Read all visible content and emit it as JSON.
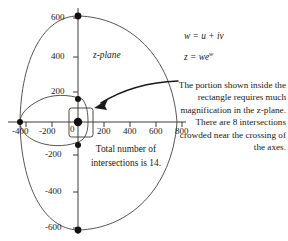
{
  "figure": {
    "plane_label": "z-plane",
    "equations": [
      {
        "lhs": "w = u + i",
        "italic_tail": "v"
      },
      {
        "lhs": "z = we",
        "exp": "w"
      }
    ],
    "equation_texts": [
      "w = u + iv",
      "z = we^w"
    ],
    "center_note": "Total number of intersections is 14.",
    "side_note": "The portion shown inside the rectangle requires much magnification in the z-plane. There are 8 intersections crowded near the crossing of the axes.",
    "colors": {
      "ink": "#1c1a18",
      "curve": "#3a3733",
      "axis": "#2a2724",
      "dot": "#141210",
      "paper": "#ffffff"
    }
  },
  "chart_data": {
    "type": "scatter",
    "title": "",
    "subtitle": "",
    "xlabel": "",
    "ylabel": "",
    "xlim": [
      -480,
      860
    ],
    "ylim": [
      -700,
      700
    ],
    "grid": false,
    "legend": null,
    "x_ticks": [
      -400,
      -200,
      0,
      200,
      400,
      600,
      800
    ],
    "x_tick_labels": [
      "-400",
      "-200",
      "0",
      "200",
      "400",
      "600",
      "800"
    ],
    "y_ticks": [
      -600,
      -400,
      -200,
      200,
      400,
      600
    ],
    "y_tick_labels": [
      "-600",
      "-400",
      "-200",
      "200",
      "400",
      "600"
    ],
    "annotations": [
      {
        "text": "z-plane",
        "x": 120,
        "y": 430
      },
      {
        "text": "Total number of intersections is 14.",
        "x": 300,
        "y": -330
      }
    ],
    "series": [
      {
        "name": "outer-oval",
        "type": "closed-curve",
        "center_x": 170,
        "center_y": 0,
        "rx": 600,
        "ry": 620,
        "description": "large oval curve through (0,600), (0,-600), (-400,0), (770,0)"
      },
      {
        "name": "inner-loop",
        "type": "closed-curve",
        "center_x": -100,
        "center_y": 0,
        "rx": 300,
        "ry": 185,
        "description": "small loop through (0,180), (0,-185), (-400,0), (40,0)"
      },
      {
        "name": "intersection-points",
        "type": "scatter",
        "points": [
          {
            "x": 0,
            "y": 600
          },
          {
            "x": 0,
            "y": 180
          },
          {
            "x": 0,
            "y": 0
          },
          {
            "x": 0,
            "y": -185
          },
          {
            "x": 0,
            "y": -600
          },
          {
            "x": -400,
            "y": 0
          }
        ],
        "marker": "filled-circle",
        "note": "8 further intersections crowded at origin, inside the rectangle"
      },
      {
        "name": "magnification-rectangle",
        "type": "rect",
        "x0": -60,
        "y0": -115,
        "x1": 120,
        "y1": 115
      },
      {
        "name": "callout-arrow",
        "type": "arrow",
        "from_x": 790,
        "from_y": 300,
        "to_x": 130,
        "to_y": 130
      }
    ]
  }
}
